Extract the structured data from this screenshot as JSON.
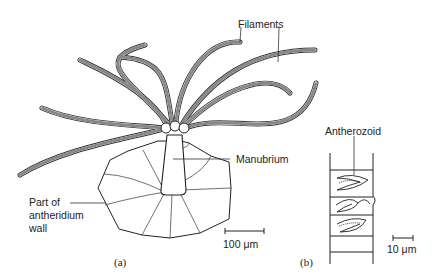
{
  "figure": {
    "panels": [
      {
        "id": "a",
        "label": "(a)"
      },
      {
        "id": "b",
        "label": "(b)"
      }
    ],
    "labels": {
      "filaments": "Filaments",
      "manubrium": "Manubrium",
      "antheridium_wall_1": "Part of",
      "antheridium_wall_2": "antheridium",
      "antheridium_wall_3": "wall",
      "antherozoid": "Antherozoid"
    },
    "scale_bars": {
      "a": "100 μm",
      "b": "10 μm"
    }
  }
}
